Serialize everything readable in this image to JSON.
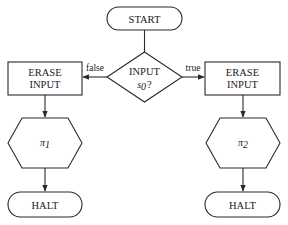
{
  "diagram": {
    "type": "flowchart",
    "nodes": {
      "start": {
        "label": "START",
        "shape": "terminal"
      },
      "decision": {
        "line1": "INPUT",
        "line2_var": "s",
        "line2_sub": "0",
        "line2_suffix": "?",
        "shape": "diamond"
      },
      "erase_left": {
        "line1": "ERASE",
        "line2": "INPUT",
        "shape": "process"
      },
      "erase_right": {
        "line1": "ERASE",
        "line2": "INPUT",
        "shape": "process"
      },
      "program_left": {
        "symbol": "π",
        "sub": "1",
        "shape": "hexagon"
      },
      "program_right": {
        "symbol": "π",
        "sub": "2",
        "shape": "hexagon"
      },
      "halt_left": {
        "label": "HALT",
        "shape": "terminal"
      },
      "halt_right": {
        "label": "HALT",
        "shape": "terminal"
      }
    },
    "edges": {
      "false_label": "false",
      "true_label": "true"
    },
    "colors": {
      "stroke": "#2a2a2a",
      "fill": "#ffffff",
      "text": "#1a1a1a"
    }
  }
}
